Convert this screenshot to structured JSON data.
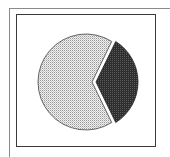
{
  "chart_data": {
    "type": "pie",
    "title": "",
    "legend": [],
    "slices": [
      {
        "label": "",
        "value": 68,
        "pattern": "light-dotted",
        "color": "#d6d6d6"
      },
      {
        "label": "",
        "value": 32,
        "pattern": "dark-dotted",
        "color": "#3c3c3c",
        "exploded": true
      }
    ],
    "annotations": []
  },
  "colors": {
    "frame": "#3a3a3a",
    "outer_frame": "#8a8a8a",
    "light_slice": "#d6d6d6",
    "dark_slice": "#3c3c3c",
    "outline": "#444444"
  }
}
